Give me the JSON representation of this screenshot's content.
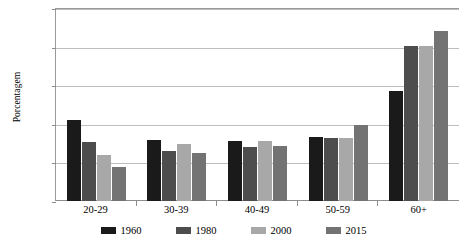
{
  "chart_data": {
    "type": "bar",
    "title": "",
    "subtitle": "",
    "xlabel": "",
    "ylabel": "Porcentagem",
    "categories": [
      "20-29",
      "30-39",
      "40-49",
      "50-59",
      "60+"
    ],
    "series": [
      {
        "name": "1960",
        "color": "#1a1a1a",
        "values": [
          21.0,
          15.9,
          15.5,
          16.5,
          28.4
        ]
      },
      {
        "name": "1980",
        "color": "#4d4d4d",
        "values": [
          15.3,
          13.0,
          13.9,
          16.4,
          40.1
        ]
      },
      {
        "name": "2000",
        "color": "#a8a8a8",
        "values": [
          12.0,
          14.9,
          15.5,
          16.4,
          40.2
        ]
      },
      {
        "name": "2015",
        "color": "#737373",
        "values": [
          8.8,
          12.5,
          14.3,
          19.8,
          44.1
        ]
      }
    ],
    "ylim": [
      0,
      50
    ],
    "yticks": [
      0,
      10,
      20,
      30,
      40,
      50
    ],
    "ytick_labels": [
      "0",
      "10",
      "20",
      "30",
      "40",
      "50"
    ],
    "grid": "horizontal",
    "legend_position": "bottom",
    "legend_entries": [
      "1960",
      "1980",
      "2000",
      "2015"
    ]
  }
}
